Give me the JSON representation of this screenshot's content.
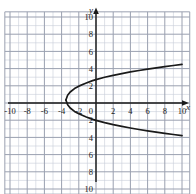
{
  "figure": {
    "name": "coordinate-plane-graph",
    "background_color": "#ffffff"
  },
  "chart_data": {
    "type": "line",
    "title": "",
    "subtitle": "",
    "xlabel": "x",
    "ylabel": "y",
    "xlim": [
      -11,
      11
    ],
    "ylim": [
      -11,
      11
    ],
    "grid": true,
    "minor_grid_step": 1,
    "major_grid_step": 2,
    "legend": null,
    "legend_position": "none",
    "x_tick_labels": [
      "-10",
      "-8",
      "-6",
      "-4",
      "-2",
      "2",
      "4",
      "6",
      "8",
      "10"
    ],
    "x_tick_values": [
      -10,
      -8,
      -6,
      -4,
      -2,
      2,
      4,
      6,
      8,
      10
    ],
    "y_tick_labels": [
      "10",
      "8",
      "6",
      "4",
      "2",
      "2",
      "4",
      "6",
      "8",
      "10"
    ],
    "y_tick_values": [
      10,
      8,
      6,
      4,
      2,
      -2,
      -4,
      -6,
      -8,
      -10
    ],
    "origin_label": "0",
    "curve_description": "rightward-opening parabola",
    "vertex": [
      -3.5,
      0.35
    ],
    "y_intercepts": [
      2.3,
      -1.6
    ],
    "series": [
      {
        "name": "parabola-upper-branch",
        "x": [
          -3.5,
          -3.3,
          -3.0,
          -2.5,
          -2.0,
          -1.2,
          -0.4,
          0.0,
          1.0,
          2.0,
          3.0,
          4.0,
          5.0,
          6.0,
          7.0,
          8.0,
          9.0,
          10.0
        ],
        "y": [
          0.35,
          0.9,
          1.28,
          1.68,
          1.96,
          2.3,
          2.6,
          2.72,
          2.99,
          3.22,
          3.42,
          3.61,
          3.78,
          3.94,
          4.09,
          4.23,
          4.36,
          4.49
        ]
      },
      {
        "name": "parabola-lower-branch",
        "x": [
          -3.5,
          -3.3,
          -3.0,
          -2.5,
          -2.0,
          -1.2,
          -0.4,
          0.0,
          1.0,
          2.0,
          3.0,
          4.0,
          5.0,
          6.0,
          7.0,
          8.0,
          9.0,
          10.0
        ],
        "y": [
          0.35,
          -0.2,
          -0.58,
          -0.98,
          -1.26,
          -1.6,
          -1.9,
          -2.02,
          -2.29,
          -2.52,
          -2.72,
          -2.91,
          -3.08,
          -3.24,
          -3.39,
          -3.53,
          -3.66,
          -3.79
        ]
      }
    ],
    "colors": {
      "curve": "#1a1a1a",
      "axis": "#1a1a1a",
      "minor_grid": "#c8ccd8",
      "major_grid": "#9aa0b0"
    }
  }
}
